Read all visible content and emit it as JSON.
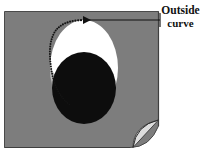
{
  "figure": {
    "name": "outside-curve-diagram",
    "canvas": {
      "width": 205,
      "height": 162,
      "background": "#ffffff"
    },
    "annotation": {
      "label_line_1": "Outside",
      "label_line_2": "curve",
      "leader_line": {
        "from_x": 160,
        "from_y": 20,
        "to_x": 81,
        "to_y": 20,
        "arrowhead": "left",
        "color": "#111111"
      }
    },
    "shapes": {
      "plate": {
        "name": "gray-plate",
        "x": 4,
        "y": 11,
        "width": 155,
        "height": 137,
        "fill": "#7d7d7d",
        "stroke": "#4f4f4f"
      },
      "outer_region": {
        "name": "white-oval",
        "cx": 84,
        "cy": 68,
        "rx": 34,
        "ry": 48,
        "fill": "#ffffff"
      },
      "inner_region": {
        "name": "black-oval",
        "cx": 84,
        "cy": 88,
        "rx": 32,
        "ry": 36,
        "fill": "#0d0d0d"
      },
      "outside_curve": {
        "name": "stippled-arc",
        "description": "dotted arc along upper-left boundary of white oval",
        "color": "#141414",
        "dots": 46
      },
      "page_curl": {
        "name": "page-curl-corner",
        "fill": "#dedede",
        "stroke": "#3a3a3a",
        "corner_x": 159,
        "corner_y": 148
      }
    }
  }
}
